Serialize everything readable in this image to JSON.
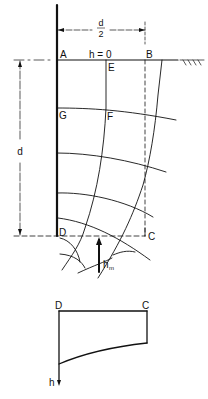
{
  "figure": {
    "type": "flow-net-diagram",
    "upper": {
      "dimension_width_label": "d",
      "dimension_width_denominator": "2",
      "dimension_depth_label": "d",
      "surface_head_label": "h = 0",
      "points": {
        "A": "A",
        "B": "B",
        "C": "C",
        "D": "D",
        "E": "E",
        "F": "F",
        "G": "G"
      },
      "max_head_label": "h",
      "max_head_subscript": "m",
      "ground_hatch": "ground-surface-hatching"
    },
    "lower": {
      "points": {
        "D": "D",
        "C": "C"
      },
      "axis_label": "h"
    },
    "colors": {
      "line": "#111111",
      "background": "#ffffff"
    }
  }
}
